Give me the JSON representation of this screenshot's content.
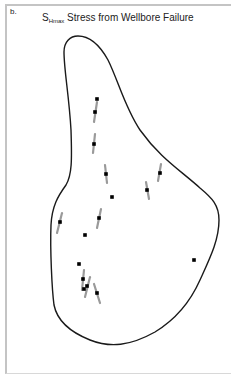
{
  "panel": {
    "label": "b."
  },
  "title": {
    "symbol": "S",
    "subscript": "Hmax",
    "text": " Stress from Wellbore Failure"
  },
  "colors": {
    "outline": "#1a1a1a",
    "stress_bar": "#9a9a9a",
    "well": "#000000",
    "frame": "#c4c4c4"
  },
  "map": {
    "outline_path": "M78,36 C70,36 64,42 64,52 C64,70 69,95 71,130 C72,160 72,175 66,185 C58,196 52,206 51,225 C50,250 52,290 54,305 C57,320 70,332 90,340 C110,348 130,346 155,332 C178,318 192,298 200,280 C210,258 219,240 219,220 C219,205 212,198 200,188 C180,170 160,158 140,130 C125,108 118,80 108,60 C98,42 88,36 78,36 Z",
    "wells_with_stress": [
      {
        "x": 95,
        "y": 112,
        "x1": 97,
        "y1": 102,
        "x2": 94,
        "y2": 122
      },
      {
        "x": 94,
        "y": 144,
        "x1": 95,
        "y1": 134,
        "x2": 93,
        "y2": 153
      },
      {
        "x": 106,
        "y": 174,
        "x1": 105,
        "y1": 165,
        "x2": 107,
        "y2": 183
      },
      {
        "x": 147,
        "y": 190,
        "x1": 146,
        "y1": 182,
        "x2": 149,
        "y2": 199
      },
      {
        "x": 160,
        "y": 173,
        "x1": 161,
        "y1": 164,
        "x2": 158,
        "y2": 181
      },
      {
        "x": 60,
        "y": 222,
        "x1": 62,
        "y1": 213,
        "x2": 57,
        "y2": 233
      },
      {
        "x": 99,
        "y": 218,
        "x1": 101,
        "y1": 209,
        "x2": 97,
        "y2": 228
      },
      {
        "x": 83,
        "y": 279,
        "x1": 84,
        "y1": 270,
        "x2": 82,
        "y2": 290
      },
      {
        "x": 87,
        "y": 286,
        "x1": 90,
        "y1": 277,
        "x2": 85,
        "y2": 297
      },
      {
        "x": 97,
        "y": 293,
        "x1": 94,
        "y1": 284,
        "x2": 100,
        "y2": 303
      }
    ],
    "wells_only": [
      {
        "x": 97,
        "y": 99
      },
      {
        "x": 112,
        "y": 197
      },
      {
        "x": 85,
        "y": 235
      },
      {
        "x": 79,
        "y": 264
      },
      {
        "x": 84,
        "y": 289
      },
      {
        "x": 194,
        "y": 260
      }
    ]
  }
}
